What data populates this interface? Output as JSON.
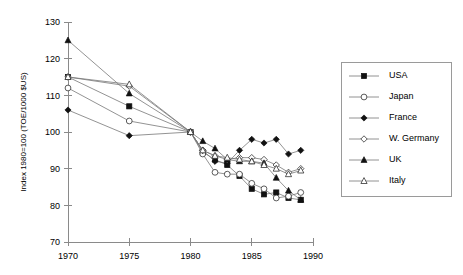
{
  "chart_data": {
    "type": "line",
    "title": "",
    "xlabel": "",
    "ylabel": "Index 1980=100  (TOE/1000 $US)",
    "xlim": [
      1970,
      1990
    ],
    "ylim": [
      70,
      130
    ],
    "xticks": [
      1970,
      1975,
      1980,
      1985,
      1990
    ],
    "yticks": [
      70,
      80,
      90,
      100,
      110,
      120,
      130
    ],
    "grid": false,
    "legend_position": "right",
    "series": [
      {
        "name": "USA",
        "marker": "filled-square",
        "x": [
          1970,
          1975,
          1980,
          1981,
          1982,
          1983,
          1984,
          1985,
          1986,
          1987,
          1988,
          1989
        ],
        "values": [
          115,
          107,
          100,
          94.5,
          92.5,
          91,
          88,
          84.5,
          83,
          83.5,
          82,
          81.5
        ]
      },
      {
        "name": "Japan",
        "marker": "open-circle",
        "x": [
          1970,
          1975,
          1980,
          1981,
          1982,
          1983,
          1984,
          1985,
          1986,
          1987,
          1988,
          1989
        ],
        "values": [
          112,
          103,
          100,
          94,
          89,
          88.5,
          88.5,
          86,
          84.5,
          82,
          82.5,
          83.5
        ]
      },
      {
        "name": "France",
        "marker": "filled-diamond",
        "x": [
          1970,
          1975,
          1980,
          1981,
          1982,
          1983,
          1984,
          1985,
          1986,
          1987,
          1988,
          1989
        ],
        "values": [
          106,
          99,
          100,
          95,
          92,
          91.5,
          95,
          98,
          97,
          98,
          94,
          95
        ]
      },
      {
        "name": "W. Germany",
        "marker": "open-diamond",
        "x": [
          1970,
          1975,
          1980,
          1981,
          1982,
          1983,
          1984,
          1985,
          1986,
          1987,
          1988,
          1989
        ],
        "values": [
          115,
          112.5,
          100,
          95,
          93.5,
          92.5,
          93,
          93,
          92.5,
          91,
          89,
          90
        ]
      },
      {
        "name": "UK",
        "marker": "filled-triangle",
        "x": [
          1970,
          1975,
          1980,
          1981,
          1982,
          1983,
          1984,
          1985,
          1986,
          1987,
          1988,
          1989
        ],
        "values": [
          125,
          110.5,
          100,
          97.5,
          95.5,
          92.5,
          92,
          92,
          91.5,
          87.5,
          84,
          81.5
        ]
      },
      {
        "name": "Italy",
        "marker": "open-triangle",
        "x": [
          1970,
          1975,
          1980,
          1981,
          1982,
          1983,
          1984,
          1985,
          1986,
          1987,
          1988,
          1989
        ],
        "values": [
          115,
          113,
          100,
          95,
          93.5,
          93,
          92.5,
          92,
          91,
          90,
          88.5,
          89.5
        ]
      }
    ]
  },
  "axes": {
    "ylabel": "Index 1980=100  (TOE/1000 $US)",
    "xticks": [
      "1970",
      "1975",
      "1980",
      "1985",
      "1990"
    ],
    "yticks": [
      "130",
      "120",
      "110",
      "100",
      "90",
      "80",
      "70"
    ]
  },
  "legend": {
    "items": [
      {
        "label": "USA",
        "marker": "filled-square"
      },
      {
        "label": "Japan",
        "marker": "open-circle"
      },
      {
        "label": "France",
        "marker": "filled-diamond"
      },
      {
        "label": "W. Germany",
        "marker": "open-diamond"
      },
      {
        "label": "UK",
        "marker": "filled-triangle"
      },
      {
        "label": "Italy",
        "marker": "open-triangle"
      }
    ]
  },
  "colors": {
    "axis": "#8a8a8a",
    "line": "#777777",
    "marker_fill": "#111111",
    "marker_open": "#ffffff",
    "text": "#000000",
    "background": "#ffffff"
  }
}
